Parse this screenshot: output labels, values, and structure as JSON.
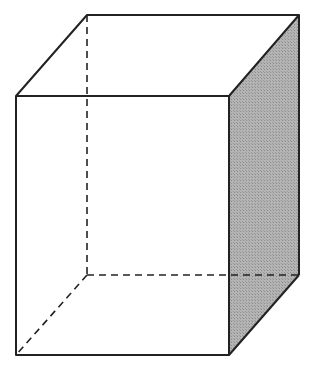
{
  "diagram": {
    "type": "rectangular-prism",
    "colors": {
      "stroke": "#222222",
      "shade": "#a9a9a9",
      "background": "#ffffff"
    },
    "vertices": {
      "front_top_left": [
        16,
        96
      ],
      "front_top_right": [
        229,
        96
      ],
      "front_bottom_left": [
        16,
        355
      ],
      "front_bottom_right": [
        229,
        355
      ],
      "back_top_left": [
        87,
        15
      ],
      "back_top_right": [
        299,
        15
      ],
      "back_bottom_left": [
        87,
        275
      ],
      "back_bottom_right": [
        299,
        275
      ]
    },
    "shaded_face": "right",
    "hidden_edges": [
      "back_top_left-back_bottom_left",
      "back_bottom_left-back_bottom_right",
      "back_bottom_left-front_bottom_left"
    ]
  }
}
